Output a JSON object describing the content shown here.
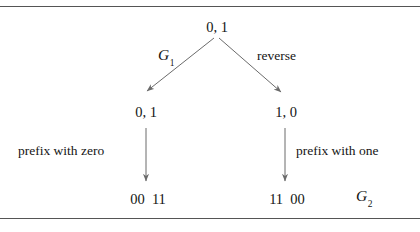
{
  "figure": {
    "background_color": "#ffffff",
    "rule_color": "#555555",
    "text_color": "#141414",
    "arrow_color": "#6b6b6b"
  },
  "tree": {
    "root": {
      "label": "0, 1"
    },
    "level2": {
      "left": "0, 1",
      "right": "1, 0"
    },
    "level3": {
      "left": "00  11",
      "right": "11  00"
    }
  },
  "edges": {
    "root_left": {
      "label_base": "G",
      "label_sub": "1"
    },
    "root_right": {
      "label": "reverse"
    },
    "left_down": {
      "label": "prefix with zero"
    },
    "right_down": {
      "label": "prefix with one"
    }
  },
  "annotations": {
    "result": {
      "label_base": "G",
      "label_sub": "2"
    }
  }
}
